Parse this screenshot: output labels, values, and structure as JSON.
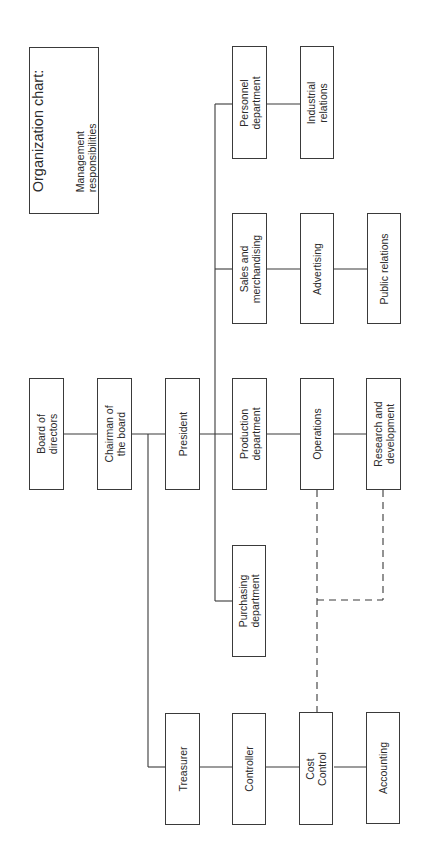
{
  "title": {
    "heading": "Organization chart:",
    "subheading": "Management\nresponsibilities"
  },
  "nodes": {
    "board": "Board of\ndirectors",
    "chairman": "Chairman of\nthe board",
    "president": "President",
    "treasurer": "Treasurer",
    "personnel": "Personnel\ndepartment",
    "sales": "Sales and\nmerchandising",
    "production": "Production\ndepartment",
    "purchasing": "Purchasing\ndepartment",
    "controller": "Controller",
    "industrial": "Industrial\nrelations",
    "advertising": "Advertising",
    "operations": "Operations",
    "cost_control": "Cost\nControl",
    "public_relations": "Public relations",
    "research": "Research and\ndevelopment",
    "accounting": "Accounting"
  },
  "relationships": {
    "solid": [
      [
        "board",
        "chairman"
      ],
      [
        "chairman",
        "president"
      ],
      [
        "chairman",
        "treasurer"
      ],
      [
        "president",
        "personnel"
      ],
      [
        "president",
        "sales"
      ],
      [
        "president",
        "production"
      ],
      [
        "president",
        "purchasing"
      ],
      [
        "personnel",
        "industrial"
      ],
      [
        "sales",
        "advertising"
      ],
      [
        "advertising",
        "public_relations"
      ],
      [
        "production",
        "operations"
      ],
      [
        "operations",
        "research"
      ],
      [
        "treasurer",
        "controller"
      ],
      [
        "controller",
        "cost_control"
      ],
      [
        "cost_control",
        "accounting"
      ]
    ],
    "dashed": [
      [
        "operations",
        "cost_control"
      ],
      [
        "research",
        "cost_control"
      ]
    ]
  }
}
